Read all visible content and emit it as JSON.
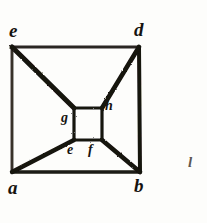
{
  "figure": {
    "caption": "",
    "ink_color": "#15120e",
    "light_ink_color": "#3a342e",
    "paper_color": "#fdfdfb",
    "outer_square": {
      "name": "outer-square",
      "vertices": [
        {
          "id": "e",
          "label": "e",
          "position": "top-left",
          "x": 12,
          "y": 47
        },
        {
          "id": "d",
          "label": "d",
          "position": "top-right",
          "x": 139,
          "y": 47
        },
        {
          "id": "b",
          "label": "b",
          "position": "bottom-right",
          "x": 140,
          "y": 172
        },
        {
          "id": "a",
          "label": "a",
          "position": "bottom-left",
          "x": 12,
          "y": 172
        }
      ]
    },
    "inner_square": {
      "name": "inner-square",
      "vertices": [
        {
          "id": "g",
          "label": "g",
          "position": "top-left",
          "x": 74,
          "y": 108
        },
        {
          "id": "h",
          "label": "h",
          "position": "top-right",
          "x": 102,
          "y": 108
        },
        {
          "id": "f",
          "label": "f",
          "position": "bottom-right",
          "x": 102,
          "y": 140
        },
        {
          "id": "e2",
          "label": "e",
          "position": "bottom-left",
          "x": 74,
          "y": 140
        }
      ]
    },
    "diagonals": [
      {
        "name": "diagonal-e-g",
        "from": "e",
        "to": "g"
      },
      {
        "name": "diagonal-d-h",
        "from": "d",
        "to": "h"
      },
      {
        "name": "diagonal-b-f",
        "from": "b",
        "to": "f"
      },
      {
        "name": "diagonal-a-e2",
        "from": "a",
        "to": "e"
      }
    ],
    "labels": {
      "outer_top_left": "e",
      "outer_top_right": "d",
      "outer_bottom_left": "a",
      "outer_bottom_right": "b",
      "inner_left": "g",
      "inner_right": "h",
      "inner_bottom_left": "e",
      "inner_bottom_right": "f"
    },
    "margin_mark": "l"
  }
}
